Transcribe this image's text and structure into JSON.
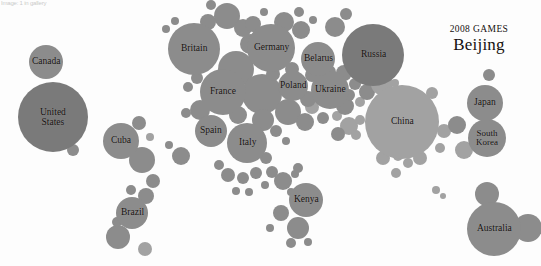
{
  "corner_note": "Image: 1 in gallery",
  "header": {
    "games_year": "2008 GAMES",
    "games_city": "Beijing"
  },
  "chart_data": {
    "type": "scatter",
    "subtype": "bubble-cartogram",
    "title": "2008 GAMES Beijing",
    "subtitle": "",
    "xlabel": "",
    "ylabel": "",
    "grid": false,
    "legend": "none",
    "axis_visible": false,
    "value_encoding": "bubble area = total medals won",
    "position_encoding": "approximate geographic location of country",
    "colors": {
      "bubble_dark": "#7a7a7a",
      "bubble_mid": "#8c8c8c",
      "bubble_light": "#a2a2a2",
      "background": "#fdfdfd",
      "label_text": "#14100e"
    },
    "labeled_countries": [
      {
        "name": "United States",
        "label": "United\nStates",
        "cx": 53,
        "cy": 117,
        "r": 35,
        "shade": "dark",
        "medals": 110,
        "font": 9.5
      },
      {
        "name": "China",
        "label": "China",
        "cx": 402,
        "cy": 122,
        "r": 37,
        "shade": "light",
        "medals": 100,
        "font": 9.5
      },
      {
        "name": "Russia",
        "label": "Russia",
        "cx": 373,
        "cy": 55,
        "r": 31,
        "shade": "dark",
        "medals": 72,
        "font": 9.5
      },
      {
        "name": "Britain",
        "label": "Britain",
        "cx": 194,
        "cy": 49,
        "r": 26,
        "shade": "mid",
        "medals": 47,
        "font": 9.5
      },
      {
        "name": "Australia",
        "label": "Australia",
        "cx": 494,
        "cy": 229,
        "r": 27,
        "shade": "mid",
        "medals": 46,
        "font": 9.5
      },
      {
        "name": "Germany",
        "label": "Germany",
        "cx": 271,
        "cy": 48,
        "r": 24,
        "shade": "mid",
        "medals": 41,
        "font": 9.5
      },
      {
        "name": "France",
        "label": "France",
        "cx": 223,
        "cy": 92,
        "r": 23,
        "shade": "mid",
        "medals": 40,
        "font": 9.5
      },
      {
        "name": "South Korea",
        "label": "South\nKorea",
        "cx": 487,
        "cy": 138,
        "r": 19,
        "shade": "mid",
        "medals": 31,
        "font": 9
      },
      {
        "name": "Italy",
        "label": "Italy",
        "cx": 247,
        "cy": 143,
        "r": 20,
        "shade": "mid",
        "medals": 28,
        "font": 9.5
      },
      {
        "name": "Ukraine",
        "label": "Ukraine",
        "cx": 330,
        "cy": 90,
        "r": 19,
        "shade": "mid",
        "medals": 27,
        "font": 9.5
      },
      {
        "name": "Japan",
        "label": "Japan",
        "cx": 485,
        "cy": 103,
        "r": 18,
        "shade": "mid",
        "medals": 25,
        "font": 9.5
      },
      {
        "name": "Cuba",
        "label": "Cuba",
        "cx": 121,
        "cy": 141,
        "r": 18,
        "shade": "mid",
        "medals": 24,
        "font": 9.5
      },
      {
        "name": "Spain",
        "label": "Spain",
        "cx": 211,
        "cy": 131,
        "r": 16,
        "shade": "mid",
        "medals": 18,
        "font": 9.5
      },
      {
        "name": "Belarus",
        "label": "Belarus",
        "cx": 318,
        "cy": 59,
        "r": 17,
        "shade": "mid",
        "medals": 19,
        "font": 9.5
      },
      {
        "name": "Canada",
        "label": "Canada",
        "cx": 46,
        "cy": 62,
        "r": 17,
        "shade": "mid",
        "medals": 18,
        "font": 9.5
      },
      {
        "name": "Brazil",
        "label": "Brazil",
        "cx": 132,
        "cy": 213,
        "r": 16,
        "shade": "mid",
        "medals": 15,
        "font": 9.5
      },
      {
        "name": "Kenya",
        "label": "Kenya",
        "cx": 306,
        "cy": 200,
        "r": 17,
        "shade": "mid",
        "medals": 14,
        "font": 9.5
      },
      {
        "name": "Poland",
        "label": "Poland",
        "cx": 293,
        "cy": 86,
        "r": 15,
        "shade": "mid",
        "medals": 10,
        "font": 9.5
      }
    ],
    "unlabeled_bubbles": [
      {
        "cx": 73,
        "cy": 150,
        "r": 6,
        "shade": "mid"
      },
      {
        "cx": 139,
        "cy": 123,
        "r": 7,
        "shade": "mid"
      },
      {
        "cx": 142,
        "cy": 160,
        "r": 13,
        "shade": "mid"
      },
      {
        "cx": 150,
        "cy": 137,
        "r": 4,
        "shade": "light"
      },
      {
        "cx": 153,
        "cy": 181,
        "r": 7,
        "shade": "mid"
      },
      {
        "cx": 131,
        "cy": 190,
        "r": 5,
        "shade": "mid"
      },
      {
        "cx": 146,
        "cy": 196,
        "r": 8,
        "shade": "mid"
      },
      {
        "cx": 118,
        "cy": 237,
        "r": 12,
        "shade": "mid"
      },
      {
        "cx": 117,
        "cy": 222,
        "r": 5,
        "shade": "mid"
      },
      {
        "cx": 145,
        "cy": 249,
        "r": 7,
        "shade": "light"
      },
      {
        "cx": 227,
        "cy": 16,
        "r": 13,
        "shade": "mid"
      },
      {
        "cx": 208,
        "cy": 22,
        "r": 8,
        "shade": "mid"
      },
      {
        "cx": 243,
        "cy": 28,
        "r": 9,
        "shade": "mid"
      },
      {
        "cx": 211,
        "cy": 5,
        "r": 5,
        "shade": "mid"
      },
      {
        "cx": 166,
        "cy": 29,
        "r": 4,
        "shade": "mid"
      },
      {
        "cx": 175,
        "cy": 21,
        "r": 4,
        "shade": "mid"
      },
      {
        "cx": 236,
        "cy": 69,
        "r": 18,
        "shade": "mid"
      },
      {
        "cx": 250,
        "cy": 44,
        "r": 10,
        "shade": "mid"
      },
      {
        "cx": 253,
        "cy": 24,
        "r": 8,
        "shade": "mid"
      },
      {
        "cx": 264,
        "cy": 12,
        "r": 4,
        "shade": "mid"
      },
      {
        "cx": 284,
        "cy": 22,
        "r": 10,
        "shade": "mid"
      },
      {
        "cx": 301,
        "cy": 30,
        "r": 9,
        "shade": "mid"
      },
      {
        "cx": 299,
        "cy": 12,
        "r": 5,
        "shade": "mid"
      },
      {
        "cx": 313,
        "cy": 20,
        "r": 4,
        "shade": "mid"
      },
      {
        "cx": 335,
        "cy": 27,
        "r": 10,
        "shade": "mid"
      },
      {
        "cx": 346,
        "cy": 14,
        "r": 6,
        "shade": "mid"
      },
      {
        "cx": 197,
        "cy": 78,
        "r": 6,
        "shade": "mid"
      },
      {
        "cx": 188,
        "cy": 87,
        "r": 5,
        "shade": "mid"
      },
      {
        "cx": 200,
        "cy": 110,
        "r": 10,
        "shade": "mid"
      },
      {
        "cx": 186,
        "cy": 113,
        "r": 5,
        "shade": "mid"
      },
      {
        "cx": 262,
        "cy": 94,
        "r": 20,
        "shade": "mid"
      },
      {
        "cx": 263,
        "cy": 120,
        "r": 11,
        "shade": "mid"
      },
      {
        "cx": 238,
        "cy": 115,
        "r": 9,
        "shade": "mid"
      },
      {
        "cx": 288,
        "cy": 112,
        "r": 13,
        "shade": "mid"
      },
      {
        "cx": 305,
        "cy": 122,
        "r": 9,
        "shade": "mid"
      },
      {
        "cx": 276,
        "cy": 131,
        "r": 6,
        "shade": "mid"
      },
      {
        "cx": 286,
        "cy": 141,
        "r": 4,
        "shade": "mid"
      },
      {
        "cx": 312,
        "cy": 107,
        "r": 7,
        "shade": "light"
      },
      {
        "cx": 323,
        "cy": 118,
        "r": 6,
        "shade": "mid"
      },
      {
        "cx": 337,
        "cy": 116,
        "r": 5,
        "shade": "light"
      },
      {
        "cx": 345,
        "cy": 106,
        "r": 9,
        "shade": "mid"
      },
      {
        "cx": 349,
        "cy": 126,
        "r": 9,
        "shade": "light"
      },
      {
        "cx": 360,
        "cy": 120,
        "r": 5,
        "shade": "light"
      },
      {
        "cx": 338,
        "cy": 134,
        "r": 7,
        "shade": "mid"
      },
      {
        "cx": 356,
        "cy": 135,
        "r": 5,
        "shade": "light"
      },
      {
        "cx": 349,
        "cy": 95,
        "r": 6,
        "shade": "mid"
      },
      {
        "cx": 360,
        "cy": 102,
        "r": 5,
        "shade": "light"
      },
      {
        "cx": 367,
        "cy": 92,
        "r": 8,
        "shade": "mid"
      },
      {
        "cx": 355,
        "cy": 84,
        "r": 6,
        "shade": "mid"
      },
      {
        "cx": 344,
        "cy": 73,
        "r": 8,
        "shade": "mid"
      },
      {
        "cx": 329,
        "cy": 72,
        "r": 7,
        "shade": "mid"
      },
      {
        "cx": 312,
        "cy": 75,
        "r": 7,
        "shade": "mid"
      },
      {
        "cx": 308,
        "cy": 99,
        "r": 8,
        "shade": "mid"
      },
      {
        "cx": 292,
        "cy": 69,
        "r": 7,
        "shade": "mid"
      },
      {
        "cx": 273,
        "cy": 74,
        "r": 7,
        "shade": "mid"
      },
      {
        "cx": 258,
        "cy": 142,
        "r": 4,
        "shade": "mid"
      },
      {
        "cx": 266,
        "cy": 158,
        "r": 6,
        "shade": "mid"
      },
      {
        "cx": 256,
        "cy": 173,
        "r": 6,
        "shade": "mid"
      },
      {
        "cx": 272,
        "cy": 172,
        "r": 6,
        "shade": "mid"
      },
      {
        "cx": 265,
        "cy": 185,
        "r": 4,
        "shade": "mid"
      },
      {
        "cx": 283,
        "cy": 181,
        "r": 9,
        "shade": "mid"
      },
      {
        "cx": 295,
        "cy": 174,
        "r": 4,
        "shade": "mid"
      },
      {
        "cx": 291,
        "cy": 192,
        "r": 4,
        "shade": "mid"
      },
      {
        "cx": 298,
        "cy": 168,
        "r": 5,
        "shade": "mid"
      },
      {
        "cx": 298,
        "cy": 228,
        "r": 11,
        "shade": "mid"
      },
      {
        "cx": 291,
        "cy": 243,
        "r": 5,
        "shade": "mid"
      },
      {
        "cx": 281,
        "cy": 213,
        "r": 8,
        "shade": "mid"
      },
      {
        "cx": 270,
        "cy": 228,
        "r": 4,
        "shade": "mid"
      },
      {
        "cx": 308,
        "cy": 242,
        "r": 4,
        "shade": "mid"
      },
      {
        "cx": 382,
        "cy": 84,
        "r": 11,
        "shade": "light"
      },
      {
        "cx": 387,
        "cy": 103,
        "r": 6,
        "shade": "light"
      },
      {
        "cx": 395,
        "cy": 83,
        "r": 4,
        "shade": "light"
      },
      {
        "cx": 432,
        "cy": 93,
        "r": 6,
        "shade": "light"
      },
      {
        "cx": 444,
        "cy": 131,
        "r": 7,
        "shade": "light"
      },
      {
        "cx": 440,
        "cy": 148,
        "r": 5,
        "shade": "light"
      },
      {
        "cx": 457,
        "cy": 125,
        "r": 9,
        "shade": "mid"
      },
      {
        "cx": 464,
        "cy": 150,
        "r": 9,
        "shade": "light"
      },
      {
        "cx": 420,
        "cy": 158,
        "r": 7,
        "shade": "light"
      },
      {
        "cx": 408,
        "cy": 163,
        "r": 5,
        "shade": "light"
      },
      {
        "cx": 398,
        "cy": 156,
        "r": 5,
        "shade": "light"
      },
      {
        "cx": 383,
        "cy": 158,
        "r": 7,
        "shade": "light"
      },
      {
        "cx": 396,
        "cy": 173,
        "r": 5,
        "shade": "light"
      },
      {
        "cx": 436,
        "cy": 190,
        "r": 4,
        "shade": "light"
      },
      {
        "cx": 443,
        "cy": 196,
        "r": 3,
        "shade": "light"
      },
      {
        "cx": 487,
        "cy": 194,
        "r": 12,
        "shade": "mid"
      },
      {
        "cx": 528,
        "cy": 228,
        "r": 14,
        "shade": "mid"
      },
      {
        "cx": 489,
        "cy": 75,
        "r": 6,
        "shade": "mid"
      },
      {
        "cx": 181,
        "cy": 156,
        "r": 9,
        "shade": "mid"
      },
      {
        "cx": 169,
        "cy": 145,
        "r": 4,
        "shade": "mid"
      },
      {
        "cx": 219,
        "cy": 165,
        "r": 5,
        "shade": "mid"
      },
      {
        "cx": 228,
        "cy": 175,
        "r": 7,
        "shade": "mid"
      },
      {
        "cx": 243,
        "cy": 178,
        "r": 6,
        "shade": "mid"
      },
      {
        "cx": 236,
        "cy": 191,
        "r": 4,
        "shade": "mid"
      },
      {
        "cx": 249,
        "cy": 192,
        "r": 4,
        "shade": "mid"
      }
    ]
  }
}
